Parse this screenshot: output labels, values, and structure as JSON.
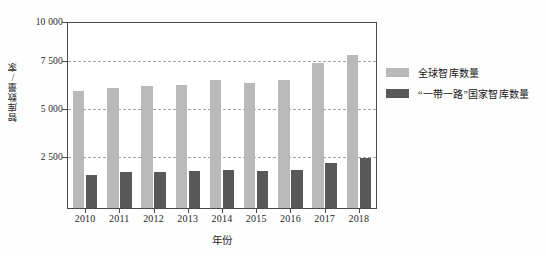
{
  "chart_data": {
    "type": "bar",
    "title": "",
    "xlabel": "年份",
    "ylabel": "智库数量/家",
    "categories": [
      "2010",
      "2011",
      "2012",
      "2013",
      "2014",
      "2015",
      "2016",
      "2017",
      "2018"
    ],
    "series": [
      {
        "name": "全球智库数量",
        "color": "#b9b9b9",
        "values": [
          6300,
          6500,
          6600,
          6650,
          6900,
          6750,
          6900,
          7850,
          8250
        ]
      },
      {
        "name": "“一带一路”国家智库数量",
        "color": "#585858",
        "values": [
          1800,
          1950,
          1930,
          2000,
          2050,
          2000,
          2050,
          2450,
          2700
        ]
      }
    ],
    "ylim": [
      0,
      10000
    ],
    "yticks": [
      2500,
      5000,
      7500,
      10000
    ],
    "ytick_labels": [
      "2 500",
      "5 000",
      "7 500",
      "10 000"
    ],
    "grid": true,
    "grid_style": "dashed",
    "grid_color": "#9aa7ad",
    "legend_position": "right",
    "axis_color": "#4a4a4a",
    "background": "#ffffff"
  }
}
